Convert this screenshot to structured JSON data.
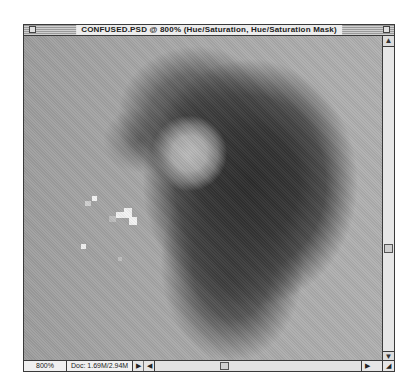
{
  "window": {
    "title": "CONFUSED.PSD @ 800% (Hue/Saturation, Hue/Saturation Mask)",
    "close_icon": "close-box-icon",
    "zoom_icon": "zoom-box-icon"
  },
  "canvas": {
    "description": "Grayscale magnified pixel image: dark blob with lighter round spot and scattered bright pixels"
  },
  "vertical_scrollbar": {
    "up_arrow": "▲",
    "down_arrow": "▼"
  },
  "status_bar": {
    "zoom_level": "800%",
    "doc_size": "Doc: 1.69M/2.94M",
    "popup_arrow": "▶",
    "left_arrow": "◀",
    "right_arrow": "▶",
    "grow_icon": "◢"
  }
}
